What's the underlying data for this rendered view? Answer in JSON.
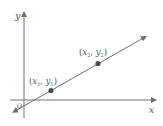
{
  "diagram": {
    "axes": {
      "x_label": "x",
      "y_label": "y",
      "origin_label": "O"
    },
    "points": [
      {
        "name": "point-1",
        "label_open": "(",
        "label_x": "x",
        "label_x_sub": "1",
        "label_sep": ", ",
        "label_y": "y",
        "label_y_sub": "1",
        "label_close": ")"
      },
      {
        "name": "point-2",
        "label_open": "(",
        "label_x": "x",
        "label_x_sub": "2",
        "label_sep": ", ",
        "label_y": "y",
        "label_y_sub": "2",
        "label_close": ")"
      }
    ],
    "colors": {
      "stroke": "#6e6e6e",
      "point": "#4a4a4a",
      "text": "#555555"
    }
  }
}
